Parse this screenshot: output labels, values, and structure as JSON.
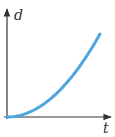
{
  "chart_data": {
    "type": "line",
    "title": "",
    "xlabel": "t",
    "ylabel": "d",
    "series": [
      {
        "name": "d vs t",
        "color": "#4da6df",
        "x": [
          0,
          0.1,
          0.2,
          0.3,
          0.4,
          0.5,
          0.6,
          0.7,
          0.8,
          0.9,
          1.0
        ],
        "y": [
          0,
          0.01,
          0.04,
          0.09,
          0.16,
          0.25,
          0.36,
          0.49,
          0.64,
          0.81,
          1.0
        ]
      }
    ],
    "xlim": [
      0,
      1.1
    ],
    "ylim": [
      0,
      1.25
    ],
    "grid": false,
    "ticks": false
  },
  "axes": {
    "x_label": "t",
    "y_label": "d",
    "axis_color": "#333333"
  }
}
